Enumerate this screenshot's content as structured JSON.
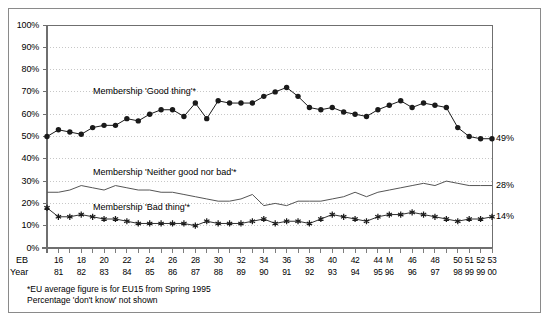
{
  "chart_data": {
    "type": "line",
    "title": "",
    "xlabel": "",
    "ylabel": "",
    "ylim": [
      0,
      100
    ],
    "ytick_labels": [
      "0%",
      "10%",
      "20%",
      "30%",
      "40%",
      "50%",
      "60%",
      "70%",
      "80%",
      "90%",
      "100%"
    ],
    "yticks": [
      0,
      10,
      20,
      30,
      40,
      50,
      60,
      70,
      80,
      90,
      100
    ],
    "grid": "horizontal dotted gridlines at every 10%",
    "legend_position": "inline annotations on plot",
    "x_axis_rows": [
      {
        "row_label": "EB",
        "values": [
          "15",
          "16",
          "17",
          "18",
          "19",
          "20",
          "21",
          "22",
          "23",
          "24",
          "25",
          "26",
          "27",
          "28",
          "29",
          "30",
          "31",
          "32",
          "33",
          "34",
          "35",
          "36",
          "37",
          "38",
          "39",
          "40",
          "41",
          "42",
          "43",
          "44",
          "M",
          "45",
          "46",
          "47",
          "48",
          "49",
          "50",
          "51",
          "52",
          "53"
        ]
      },
      {
        "row_label": "Year",
        "values": [
          "81",
          "81",
          "82",
          "82",
          "83",
          "83",
          "84",
          "84",
          "85",
          "85",
          "86",
          "86",
          "87",
          "87",
          "88",
          "88",
          "89",
          "89",
          "90",
          "90",
          "91",
          "91",
          "92",
          "92",
          "93",
          "93",
          "94",
          "94",
          "95",
          "95",
          "96",
          "96",
          "96",
          "97",
          "97",
          "98",
          "98",
          "99",
          "99",
          "00"
        ]
      }
    ],
    "x_tick_labels_shown": [
      {
        "index": 1,
        "eb": "16",
        "year": "81"
      },
      {
        "index": 3,
        "eb": "18",
        "year": "82"
      },
      {
        "index": 5,
        "eb": "20",
        "year": "83"
      },
      {
        "index": 7,
        "eb": "22",
        "year": "84"
      },
      {
        "index": 9,
        "eb": "24",
        "year": "85"
      },
      {
        "index": 11,
        "eb": "26",
        "year": "86"
      },
      {
        "index": 13,
        "eb": "28",
        "year": "87"
      },
      {
        "index": 15,
        "eb": "30",
        "year": "88"
      },
      {
        "index": 17,
        "eb": "32",
        "year": "89"
      },
      {
        "index": 19,
        "eb": "34",
        "year": "90"
      },
      {
        "index": 21,
        "eb": "36",
        "year": "91"
      },
      {
        "index": 23,
        "eb": "38",
        "year": "92"
      },
      {
        "index": 25,
        "eb": "40",
        "year": "93"
      },
      {
        "index": 27,
        "eb": "42",
        "year": "94"
      },
      {
        "index": 29,
        "eb": "44",
        "year": "95"
      },
      {
        "index": 30,
        "eb": "M",
        "year": "96"
      },
      {
        "index": 32,
        "eb": "46",
        "year": "96"
      },
      {
        "index": 34,
        "eb": "48",
        "year": "97"
      },
      {
        "index": 36,
        "eb": "50",
        "year": "98"
      },
      {
        "index": 37,
        "eb": "51",
        "year": "99"
      },
      {
        "index": 38,
        "eb": "52",
        "year": "99"
      },
      {
        "index": 39,
        "eb": "53",
        "year": "00"
      }
    ],
    "series": [
      {
        "name": "Membership 'Good thing'*",
        "marker": "filled-circle",
        "end_value_label": "49%",
        "values": [
          50,
          53,
          52,
          51,
          54,
          55,
          55,
          58,
          57,
          60,
          62,
          62,
          59,
          65,
          58,
          66,
          65,
          65,
          65,
          68,
          70,
          72,
          68,
          63,
          62,
          63,
          61,
          60,
          59,
          62,
          64,
          66,
          63,
          65,
          64,
          63,
          54,
          50,
          49,
          49
        ]
      },
      {
        "name": "Membership 'Neither good nor bad'*",
        "marker": "none",
        "end_value_label": "28%",
        "values": [
          25,
          25,
          26,
          28,
          27,
          26,
          28,
          27,
          26,
          26,
          25,
          25,
          24,
          23,
          22,
          21,
          21,
          22,
          24,
          19,
          20,
          19,
          21,
          21,
          21,
          22,
          23,
          25,
          23,
          25,
          26,
          27,
          28,
          29,
          28,
          30,
          29,
          28,
          28,
          28
        ]
      },
      {
        "name": "Membership 'Bad thing'*",
        "marker": "star",
        "end_value_label": "14%",
        "values": [
          18,
          14,
          14,
          15,
          14,
          13,
          13,
          12,
          11,
          11,
          11,
          11,
          11,
          10,
          12,
          11,
          11,
          11,
          12,
          13,
          11,
          12,
          12,
          11,
          13,
          15,
          14,
          13,
          12,
          14,
          15,
          15,
          16,
          15,
          14,
          13,
          12,
          13,
          13,
          14
        ]
      }
    ],
    "annotations": [
      "Membership 'Good thing'*",
      "Membership 'Neither good nor bad'*",
      "Membership 'Bad thing'*"
    ],
    "footnotes": [
      "*EU average figure is for EU15 from Spring 1995",
      "Percentage 'don't know' not shown"
    ]
  },
  "axis": {
    "row1_tag": "EB",
    "row2_tag": "Year"
  },
  "labels": {
    "good": "Membership 'Good thing'*",
    "neither": "Membership 'Neither good nor bad'*",
    "bad": "Membership 'Bad thing'*",
    "end_good": "49%",
    "end_neither": "28%",
    "end_bad": "14%"
  },
  "footnotes": {
    "line1": "*EU average figure is for EU15 from Spring 1995",
    "line2": "Percentage 'don't know' not shown"
  },
  "colors": {
    "line": "#1a1a1a",
    "neither_line": "#555555",
    "grid": "#b9b9b9",
    "axis": "#6f6f6f",
    "frame": "#8a8a8a"
  }
}
